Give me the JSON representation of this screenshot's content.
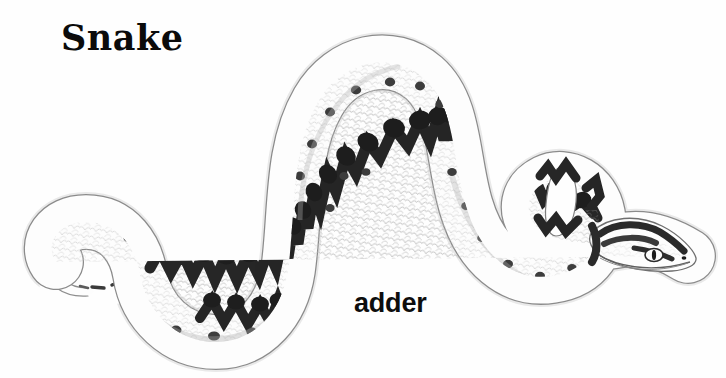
{
  "page": {
    "background_color": "#fefefe",
    "width": 726,
    "height": 378
  },
  "title": {
    "text": "Snake",
    "color": "#0b0b0b"
  },
  "caption": {
    "text": "adder",
    "color": "#0d0d0d"
  },
  "illustration": {
    "name": "adder-snake-illustration",
    "subject": "adder",
    "style": "black-and-white engraved natural-history drawing",
    "description": "A serpentine snake body winding in an S-curve across the frame, tail curled at the far left, two large humps rising in the middle, a tight neck loop at the right, and the head pointing right with a visible eye.",
    "ink_color": "#1c1c1c",
    "outline_color": "#555555",
    "body_fill": "#ffffff",
    "scale_texture_color": "#b9b9b9",
    "features": {
      "dorsal_pattern": "zigzag chevron stripe running the full length of the back",
      "lateral_spots": "row of dark rounded blotches along each flank",
      "head": "arrow-shaped viper head pointing right with dark markings",
      "eye": "pale oval with a dark vertical pupil",
      "tail": "thin tapering tail curled into a hook at the left"
    }
  }
}
